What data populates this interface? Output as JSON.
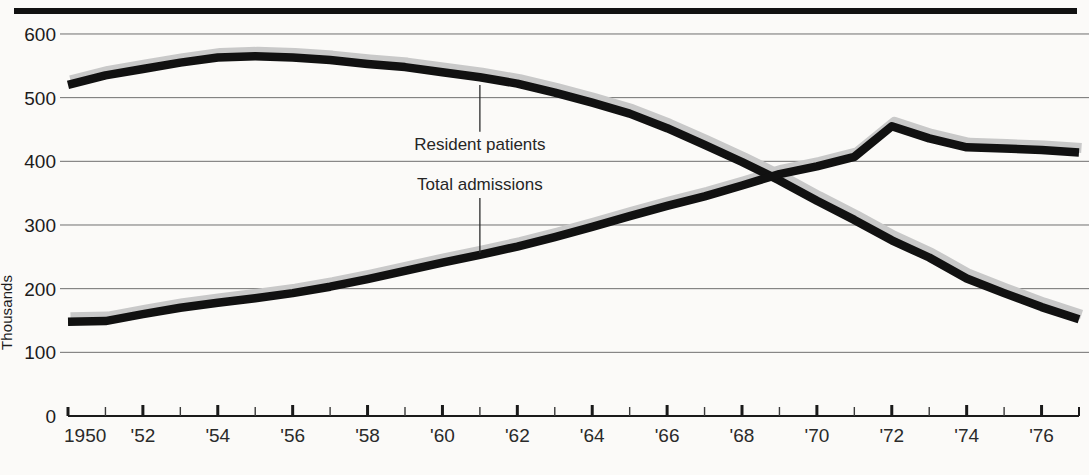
{
  "chart_data": {
    "type": "line",
    "title": "",
    "subtitle": "",
    "xlabel": "",
    "ylabel": "Thousands",
    "xlim": [
      1950,
      1977
    ],
    "ylim": [
      0,
      620
    ],
    "y_ticks": [
      100,
      200,
      300,
      400,
      500,
      600
    ],
    "y_tick_labels": [
      "100",
      "200",
      "300",
      "400",
      "500",
      "600"
    ],
    "origin_label": "0",
    "grid": "horizontal",
    "legend": "inline-annotations",
    "x": [
      1950,
      1951,
      1952,
      1953,
      1954,
      1955,
      1956,
      1957,
      1958,
      1959,
      1960,
      1961,
      1962,
      1963,
      1964,
      1965,
      1966,
      1967,
      1968,
      1969,
      1970,
      1971,
      1972,
      1973,
      1974,
      1975,
      1976,
      1977
    ],
    "x_major_ticks": [
      1950,
      1952,
      1954,
      1956,
      1958,
      1960,
      1962,
      1964,
      1966,
      1968,
      1970,
      1972,
      1974,
      1976
    ],
    "x_tick_labels": [
      "1950",
      "'52",
      "'54",
      "'56",
      "'58",
      "'60",
      "'62",
      "'64",
      "'66",
      "'68",
      "'70",
      "'72",
      "'74",
      "'76"
    ],
    "x_minor_ticks": [
      1951,
      1953,
      1955,
      1957,
      1959,
      1961,
      1963,
      1965,
      1967,
      1969,
      1971,
      1973,
      1975,
      1977
    ],
    "series": [
      {
        "name": "Resident patients",
        "color": "#111111",
        "shadow_color": "#c9c9c9",
        "values": [
          520,
          535,
          545,
          555,
          563,
          565,
          563,
          559,
          553,
          548,
          540,
          532,
          522,
          508,
          492,
          475,
          452,
          426,
          399,
          370,
          338,
          308,
          276,
          249,
          216,
          193,
          171,
          152
        ]
      },
      {
        "name": "Total admissions",
        "color": "#111111",
        "shadow_color": "#c9c9c9",
        "values": [
          148,
          149,
          160,
          170,
          178,
          185,
          193,
          203,
          215,
          228,
          241,
          253,
          266,
          281,
          297,
          314,
          330,
          345,
          362,
          380,
          392,
          407,
          455,
          436,
          422,
          420,
          418,
          414
        ]
      }
    ],
    "annotations": [
      {
        "text": "Resident patients",
        "series": "Resident patients",
        "label_x": 1960.8,
        "label_y": 418,
        "leader_year": 1961,
        "leader_to": 520
      },
      {
        "text": "Total admissions",
        "series": "Total admissions",
        "label_x": 1960.8,
        "label_y": 355,
        "leader_year": 1961,
        "leader_to": 256
      }
    ]
  }
}
